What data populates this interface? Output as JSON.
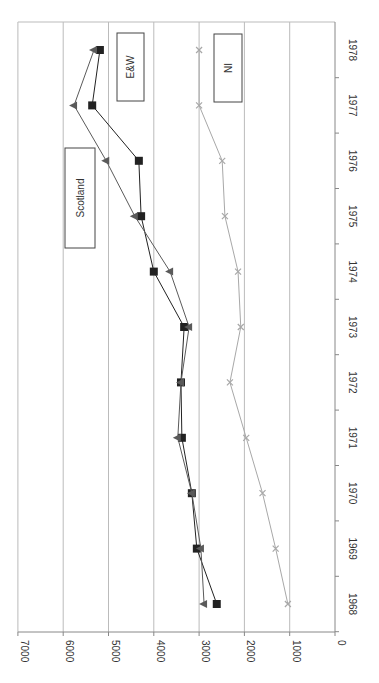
{
  "chart_data": {
    "type": "line",
    "orientation": "rotated 90deg clockwise (years along vertical, values along horizontal)",
    "title": "",
    "xlabel": "",
    "ylabel": "",
    "x": [
      1968,
      1969,
      1970,
      1971,
      1972,
      1973,
      1974,
      1975,
      1976,
      1977,
      1978
    ],
    "ylim": [
      0,
      7000
    ],
    "yticks": [
      0,
      1000,
      2000,
      3000,
      4000,
      5000,
      6000,
      7000
    ],
    "grid": true,
    "series": [
      {
        "name": "E&W",
        "marker": "square",
        "color": "#222222",
        "values": [
          2610,
          3050,
          3160,
          3380,
          3400,
          3330,
          4000,
          4280,
          4330,
          5360,
          5190
        ]
      },
      {
        "name": "Scotland",
        "marker": "triangle",
        "color": "#5a5a5a",
        "values": [
          2890,
          2960,
          3160,
          3470,
          3400,
          3220,
          3640,
          4420,
          5050,
          5760,
          5320
        ]
      },
      {
        "name": "NI",
        "marker": "x",
        "color": "#a8a8a8",
        "values": [
          1040,
          1310,
          1600,
          1960,
          2320,
          2080,
          2140,
          2430,
          2490,
          3000,
          3000
        ]
      }
    ],
    "annotations": [
      "Scotland",
      "E&W",
      "NI"
    ]
  },
  "labels": {
    "scotland": "Scotland",
    "ew": "E&W",
    "ni": "NI"
  }
}
